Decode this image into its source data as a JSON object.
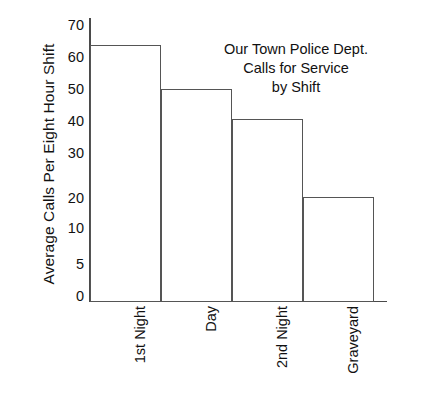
{
  "chart_data": {
    "type": "bar",
    "title": "Our Town Police Dept. Calls for Service by Shift",
    "title_lines": [
      "Our Town Police Dept.",
      "Calls for Service",
      "by Shift"
    ],
    "xlabel": "",
    "ylabel": "Average Calls Per Eight Hour Shift",
    "categories": [
      "1st Night",
      "Day",
      "2nd Night",
      "Graveyard"
    ],
    "values": [
      66,
      53,
      44,
      21
    ],
    "ylim": [
      0,
      70
    ],
    "ytick_labels": [
      "70",
      "60",
      "50",
      "40",
      "30",
      "20",
      "10",
      "5",
      "0"
    ],
    "ytick_values": [
      70,
      60,
      50,
      40,
      30,
      20,
      10,
      5,
      0
    ],
    "grid": false,
    "legend": null,
    "bar_style": {
      "fill": "#ffffff",
      "edge": "#555555"
    },
    "axis_color": "#4a4a4a",
    "text_color": "#111111",
    "background": "#ffffff"
  },
  "axis_geometry": {
    "tick_y_px": [
      25,
      57,
      89,
      121,
      153,
      198,
      228,
      264,
      296
    ],
    "bar_top_px": [
      44,
      88,
      118,
      196
    ],
    "bar_left_px": [
      1,
      72,
      143,
      214
    ],
    "bar_width_px": 71,
    "baseline_px": 301
  }
}
